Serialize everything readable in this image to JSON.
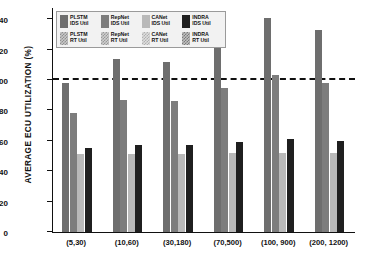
{
  "chart_data": {
    "type": "bar",
    "title": "",
    "xlabel": "",
    "ylabel": "AVERAGE  ECU  UTILIZATION (%)",
    "ylim": [
      0,
      148
    ],
    "yticks": [
      0,
      20,
      40,
      60,
      80,
      100,
      120,
      140
    ],
    "grid": false,
    "legend_position": "upper-left",
    "categories": [
      "(5,30)",
      "(10,60)",
      "(30,180)",
      "(70,500)",
      "(100, 900)",
      "(200, 1200)"
    ],
    "annotations": [
      {
        "name": "utilization-threshold",
        "type": "hline",
        "value": 100,
        "style": "dashed",
        "color": "#111111"
      }
    ],
    "series": [
      {
        "name": "PLSTM IDS Util",
        "color": "#6e6e6e",
        "fill": "solid",
        "values": [
          98,
          114,
          112,
          127,
          141,
          133
        ]
      },
      {
        "name": "RepNet IDS Util",
        "color": "#7d7d7d",
        "fill": "solid",
        "values": [
          78,
          87,
          86,
          95,
          103,
          98
        ]
      },
      {
        "name": "CANet IDS Util",
        "color": "#b9b9b9",
        "fill": "solid",
        "values": [
          51,
          51,
          51,
          52,
          52,
          52
        ]
      },
      {
        "name": "INDRA IDS Util",
        "color": "#1f1f1f",
        "fill": "solid",
        "values": [
          55,
          57,
          57,
          59,
          61,
          60
        ]
      },
      {
        "name": "PLSTM RT Util",
        "color": "#c8c8c8",
        "fill": "hatched",
        "values": [
          50,
          50,
          50,
          51,
          51,
          51
        ]
      },
      {
        "name": "RepNet RT Util",
        "color": "#cfcfcf",
        "fill": "hatched",
        "values": [
          50,
          51,
          51,
          51,
          52,
          51
        ]
      },
      {
        "name": "CANet RT Util",
        "color": "#dedede",
        "fill": "hatched",
        "values": [
          50,
          50,
          50,
          51,
          51,
          51
        ]
      },
      {
        "name": "INDRA RT Util",
        "color": "#c0c0c0",
        "fill": "hatched",
        "values": [
          50,
          50,
          50,
          51,
          51,
          51
        ]
      }
    ]
  },
  "legend": {
    "row1": [
      {
        "line1": "PLSTM",
        "line2": "IDS Util",
        "swatch": "#6e6e6e",
        "key": "plstm-ids"
      },
      {
        "line1": "RepNet",
        "line2": "IDS Util",
        "swatch": "#7d7d7d",
        "key": "repnet-ids"
      },
      {
        "line1": "CANet",
        "line2": "IDS Util",
        "swatch": "#b9b9b9",
        "key": "canet-ids"
      },
      {
        "line1": "INDRA",
        "line2": "IDS Util",
        "swatch": "#1f1f1f",
        "key": "indra-ids"
      }
    ],
    "row2": [
      {
        "line1": "PLSTM",
        "line2": "RT Util",
        "swatch": "#c8c8c8",
        "key": "plstm-rt"
      },
      {
        "line1": "RepNet",
        "line2": "RT Util",
        "swatch": "#cfcfcf",
        "key": "repnet-rt"
      },
      {
        "line1": "CANet",
        "line2": "RT Util",
        "swatch": "#dedede",
        "key": "canet-rt"
      },
      {
        "line1": "INDRA",
        "line2": "RT Util",
        "swatch": "#c0c0c0",
        "key": "indra-rt"
      }
    ]
  }
}
